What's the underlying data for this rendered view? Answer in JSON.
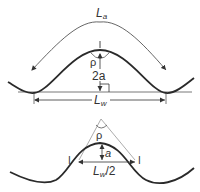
{
  "top_figure": {
    "arc_length_label": "L",
    "arc_length_subscript": "a",
    "angle_label": "ρ",
    "amplitude_label": "2a",
    "wavelength_label": "L",
    "wavelength_subscript": "w"
  },
  "bottom_figure": {
    "angle_label": "ρ",
    "amplitude_label": "a",
    "half_wavelength_label": "L",
    "half_wavelength_subscript": "w",
    "half_wavelength_suffix": "/2",
    "inflection_mark_left": "I",
    "inflection_mark_right": "I"
  },
  "colors": {
    "wave": "#2a2a2a",
    "annotation": "#555555",
    "guide": "#888888"
  }
}
